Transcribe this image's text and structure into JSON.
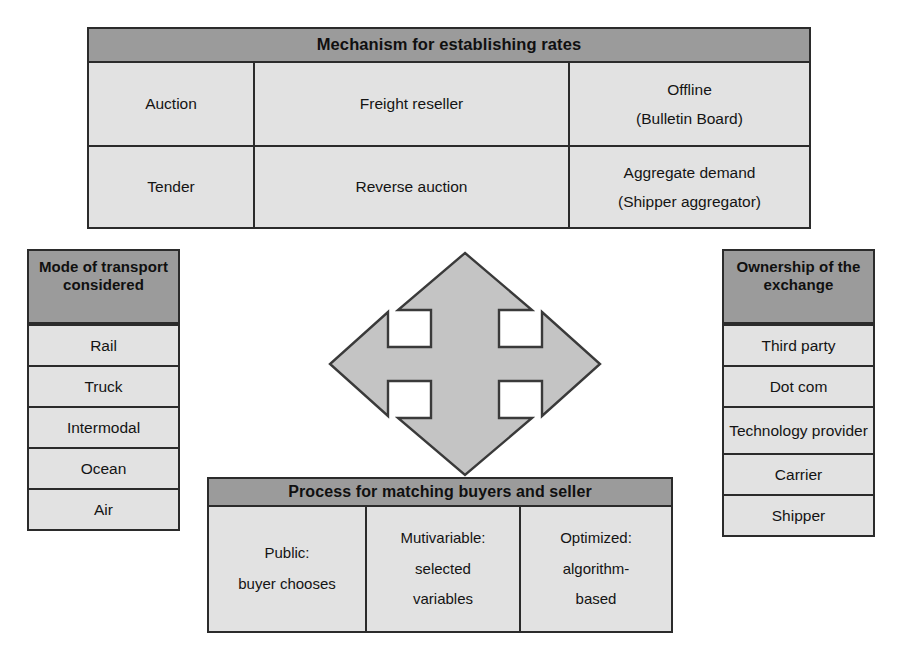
{
  "diagram": {
    "colors": {
      "header_fill": "#9b9b9b",
      "cell_fill": "#e2e2e2",
      "border": "#2b2b2b",
      "arrow_fill": "#c4c4c4",
      "arrow_stroke": "#3a3a3a",
      "page_background": "#ffffff"
    }
  },
  "mechanism": {
    "header": "Mechanism for establishing rates",
    "rows": [
      {
        "cells": [
          {
            "lines": [
              "Auction"
            ]
          },
          {
            "lines": [
              "Freight reseller"
            ]
          },
          {
            "lines": [
              "Offline",
              "(Bulletin Board)"
            ]
          }
        ]
      },
      {
        "cells": [
          {
            "lines": [
              "Tender"
            ]
          },
          {
            "lines": [
              "Reverse auction"
            ]
          },
          {
            "lines": [
              "Aggregate demand",
              "(Shipper aggregator)"
            ]
          }
        ]
      }
    ]
  },
  "mode_of_transport": {
    "header": "Mode of transport considered",
    "options": [
      "Rail",
      "Truck",
      "Intermodal",
      "Ocean",
      "Air"
    ]
  },
  "ownership": {
    "header": "Ownership of the exchange",
    "options": [
      "Third party",
      "Dot com",
      "Technology provider",
      "Carrier",
      "Shipper"
    ]
  },
  "process": {
    "header": "Process for matching buyers and seller",
    "cells": [
      {
        "lines": [
          "Public:",
          "buyer chooses"
        ]
      },
      {
        "lines": [
          "Mutivariable:",
          "selected",
          "variables"
        ]
      },
      {
        "lines": [
          "Optimized:",
          "algorithm-",
          "based"
        ]
      }
    ]
  },
  "center_arrow": {
    "icon": "four-way-arrow-icon",
    "directions": [
      "up",
      "right",
      "down",
      "left"
    ]
  }
}
